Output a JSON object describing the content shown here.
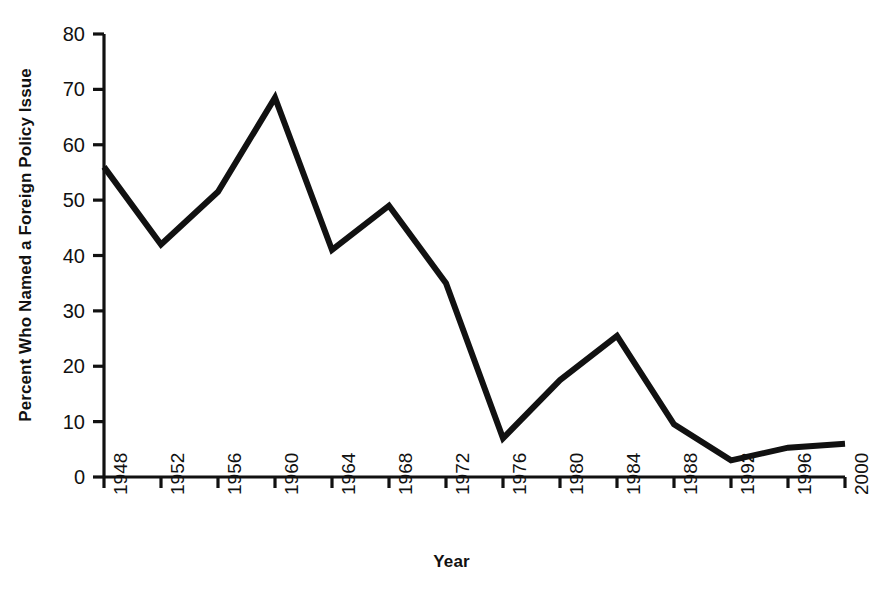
{
  "chart_data": {
    "type": "line",
    "title": "",
    "xlabel": "Year",
    "ylabel": "Percent Who Named a Foreign Policy Issue",
    "x": [
      1948,
      1952,
      1956,
      1960,
      1964,
      1968,
      1972,
      1976,
      1980,
      1984,
      1988,
      1992,
      1996,
      2000
    ],
    "categories": [
      "1948",
      "1952",
      "1956",
      "1960",
      "1964",
      "1968",
      "1972",
      "1976",
      "1980",
      "1984",
      "1988",
      "1992",
      "1996",
      "2000"
    ],
    "values": [
      56,
      42,
      51.5,
      68.5,
      41,
      49,
      35,
      7,
      17.5,
      25.5,
      9.5,
      3,
      5.3,
      6
    ],
    "series": [
      {
        "name": "Percent Who Named a Foreign Policy Issue",
        "values": [
          56,
          42,
          51.5,
          68.5,
          41,
          49,
          35,
          7,
          17.5,
          25.5,
          9.5,
          3,
          5.3,
          6
        ]
      }
    ],
    "xlim": [
      1948,
      2000
    ],
    "ylim": [
      0,
      80
    ],
    "ytick_values": [
      0,
      10,
      20,
      30,
      40,
      50,
      60,
      70,
      80
    ],
    "ytick_labels": [
      "0",
      "10",
      "20",
      "30",
      "40",
      "50",
      "60",
      "70",
      "80"
    ],
    "xtick_labels": [
      "1948",
      "1952",
      "1956",
      "1960",
      "1964",
      "1968",
      "1972",
      "1976",
      "1980",
      "1984",
      "1988",
      "1992",
      "1996",
      "2000"
    ],
    "grid": false,
    "legend": false,
    "legend_position": "none",
    "line_color": "#111111",
    "line_width": 6,
    "axis_color": "#111111",
    "background_color": "#ffffff",
    "xtick_rotation": -90
  },
  "axes": {
    "y_title": "Percent Who Named a Foreign Policy Issue",
    "x_title": "Year"
  }
}
